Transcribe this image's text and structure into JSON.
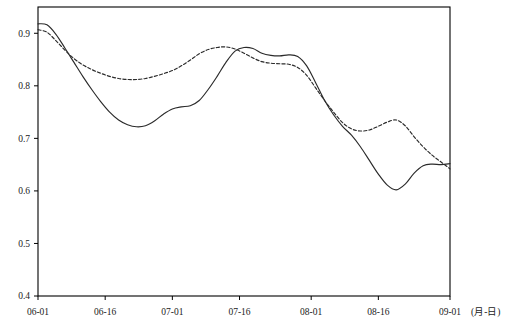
{
  "chart_data": {
    "type": "line",
    "title": "",
    "subtitle": "",
    "xlabel": "(月-日)",
    "ylabel": "",
    "xlim": [
      "06-01",
      "09-01"
    ],
    "ylim": [
      0.4,
      0.95
    ],
    "grid": false,
    "legend": null,
    "x_tick_labels": [
      "06-01",
      "06-16",
      "07-01",
      "07-16",
      "08-01",
      "08-16",
      "09-01"
    ],
    "x_tick_days": [
      0,
      15,
      30,
      45,
      61,
      76,
      92
    ],
    "y_tick_labels": [
      "0.4",
      "0.5",
      "0.6",
      "0.7",
      "0.8",
      "0.9"
    ],
    "y_tick_values": [
      0.4,
      0.5,
      0.6,
      0.7,
      0.8,
      0.9
    ],
    "axis_unit_label": "(月-日)",
    "series": [
      {
        "name": "solid-series",
        "style": "solid",
        "color": "#2b2b2b",
        "x": [
          0,
          2,
          4,
          6,
          8,
          10,
          12,
          14,
          16,
          18,
          20,
          22,
          24,
          26,
          28,
          30,
          32,
          34,
          36,
          38,
          40,
          42,
          44,
          46,
          48,
          50,
          52,
          54,
          56,
          58,
          60,
          62,
          64,
          66,
          68,
          70,
          72,
          74,
          76,
          78,
          80,
          82,
          84,
          86,
          88,
          90,
          92
        ],
        "values": [
          0.918,
          0.916,
          0.898,
          0.872,
          0.845,
          0.818,
          0.793,
          0.77,
          0.75,
          0.735,
          0.726,
          0.722,
          0.724,
          0.733,
          0.746,
          0.756,
          0.76,
          0.762,
          0.772,
          0.793,
          0.818,
          0.845,
          0.866,
          0.873,
          0.871,
          0.862,
          0.858,
          0.857,
          0.859,
          0.856,
          0.838,
          0.806,
          0.772,
          0.745,
          0.723,
          0.706,
          0.684,
          0.658,
          0.632,
          0.611,
          0.602,
          0.613,
          0.634,
          0.648,
          0.651,
          0.65,
          0.652
        ]
      },
      {
        "name": "dashed-series",
        "style": "dashed",
        "color": "#2b2b2b",
        "x": [
          0,
          2,
          4,
          6,
          8,
          10,
          12,
          14,
          16,
          18,
          20,
          22,
          24,
          26,
          28,
          30,
          32,
          34,
          36,
          38,
          40,
          42,
          44,
          46,
          48,
          50,
          52,
          54,
          56,
          58,
          60,
          62,
          64,
          66,
          68,
          70,
          72,
          74,
          76,
          78,
          80,
          82,
          84,
          86,
          88,
          90,
          92
        ],
        "values": [
          0.907,
          0.902,
          0.886,
          0.868,
          0.852,
          0.84,
          0.831,
          0.824,
          0.818,
          0.814,
          0.812,
          0.812,
          0.814,
          0.818,
          0.823,
          0.829,
          0.838,
          0.849,
          0.861,
          0.869,
          0.873,
          0.874,
          0.87,
          0.862,
          0.853,
          0.846,
          0.843,
          0.842,
          0.841,
          0.835,
          0.82,
          0.796,
          0.772,
          0.75,
          0.73,
          0.718,
          0.714,
          0.716,
          0.723,
          0.731,
          0.735,
          0.724,
          0.703,
          0.684,
          0.668,
          0.655,
          0.642
        ]
      }
    ],
    "annotations": []
  },
  "notable_points": {
    "solid_start": 0.918,
    "solid_first_trough": 0.722,
    "solid_peak": 0.873,
    "solid_min": 0.602,
    "solid_end": 0.652,
    "dashed_start": 0.907,
    "dashed_first_trough": 0.812,
    "dashed_peak": 0.874,
    "dashed_end": 0.53
  }
}
